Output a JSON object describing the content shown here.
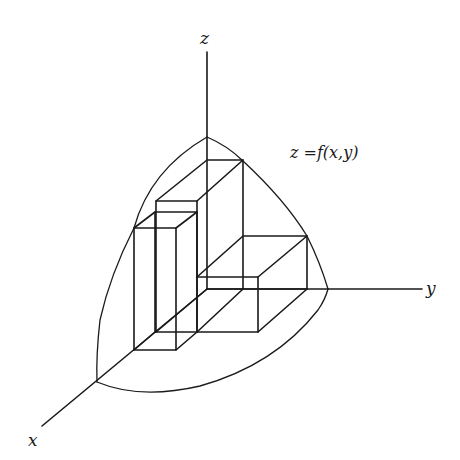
{
  "figure": {
    "type": "3d-riemann-sum-diagram",
    "axes": {
      "x_label": "x",
      "y_label": "y",
      "z_label": "z"
    },
    "surface_label": "z =f(x,y)",
    "colors": {
      "stroke": "#1a1a1a",
      "background": "#ffffff"
    },
    "boxes": [
      {
        "name": "tall-back-box",
        "position": "back-left, along x from origin"
      },
      {
        "name": "front-left-box",
        "position": "front, further along x"
      },
      {
        "name": "right-box",
        "position": "along y from origin, shorter"
      }
    ]
  }
}
